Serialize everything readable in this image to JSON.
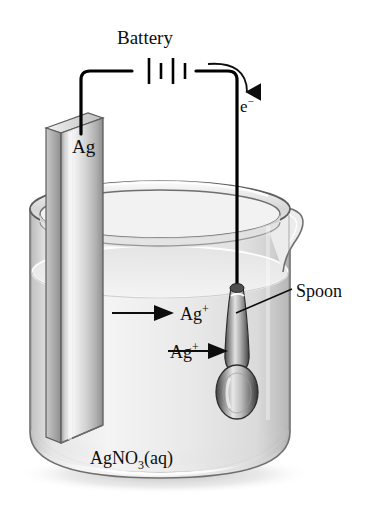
{
  "figure": {
    "background_color": "#ffffff"
  },
  "labels": {
    "battery": "Battery",
    "electron": "e",
    "electron_charge": "−",
    "electrode": "Ag",
    "spoon": "Spoon",
    "ion_upper": "Ag",
    "ion_upper_charge": "+",
    "ion_lower": "Ag",
    "ion_lower_charge": "+",
    "solution": "AgNO",
    "solution_sub": "3",
    "solution_state": "(aq)"
  },
  "colors": {
    "ink": "#0d0d0d",
    "wire": "#000000",
    "glass_outline": "#6b6b6b",
    "glass_light": "#f2f2f2",
    "glass_mid": "#d9d9d9",
    "glass_dark": "#b0b0b0",
    "liquid_light": "#ededed",
    "liquid_mid": "#dcdcdc",
    "metal_light": "#fbfbfb",
    "metal_mid": "#c9c9c9",
    "metal_dark": "#8a8a8a",
    "metal_edge": "#5a5a5a",
    "shadow": "#cfcfcf"
  },
  "components": {
    "battery": {
      "name": "battery-symbol",
      "plate_count": 4,
      "cells": 2
    },
    "electrode": {
      "name": "silver-electrode",
      "material": "Ag",
      "role": "anode"
    },
    "spoon": {
      "name": "spoon-cathode",
      "role": "cathode"
    },
    "beaker": {
      "name": "beaker",
      "has_spout": true,
      "contents": "AgNO3(aq)"
    }
  }
}
